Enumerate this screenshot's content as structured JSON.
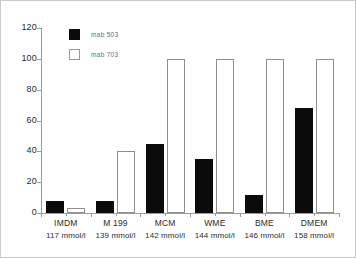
{
  "chart_data": {
    "type": "bar",
    "title": "",
    "xlabel": "",
    "ylabel": "",
    "ylim": [
      0,
      120
    ],
    "yticks": [
      0,
      20,
      40,
      60,
      80,
      100,
      120
    ],
    "grid": false,
    "legend_position": "top-left",
    "categories": [
      "IMDM",
      "M 199",
      "MCM",
      "WME",
      "BME",
      "DMEM"
    ],
    "category_sublabels": [
      "117 mmol/l",
      "139 mmol/l",
      "142 mmol/l",
      "144 mmol/l",
      "146 mmol/l",
      "158 mmol/l"
    ],
    "series": [
      {
        "name": "mab 503",
        "style": "filled",
        "color": "#0b0b0b",
        "values": [
          8,
          8,
          45,
          35,
          12,
          68
        ]
      },
      {
        "name": "mab 703",
        "style": "open",
        "color": "#ffffff",
        "values": [
          3,
          40,
          100,
          100,
          100,
          100
        ]
      }
    ]
  },
  "axes": {
    "y_tick_labels": [
      "0",
      "20",
      "40",
      "60",
      "80",
      "100",
      "120"
    ],
    "axis_color": "#9a9a9a"
  },
  "legend": {
    "entries": [
      {
        "label": "mab 503",
        "style": "filled"
      },
      {
        "label": "mab 703",
        "style": "open"
      }
    ]
  }
}
